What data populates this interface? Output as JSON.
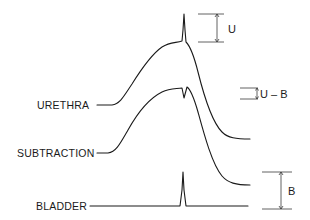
{
  "diagram": {
    "traces": [
      {
        "id": "urethra",
        "label": "URETHRA"
      },
      {
        "id": "subtraction",
        "label": "SUBTRACTION"
      },
      {
        "id": "bladder",
        "label": "BLADDER"
      }
    ],
    "measurements": [
      {
        "id": "u",
        "label": "U"
      },
      {
        "id": "u-minus-b",
        "label": "U – B"
      },
      {
        "id": "b",
        "label": "B"
      }
    ],
    "colors": {
      "ink": "#1a1a1a",
      "background": "#ffffff"
    }
  }
}
